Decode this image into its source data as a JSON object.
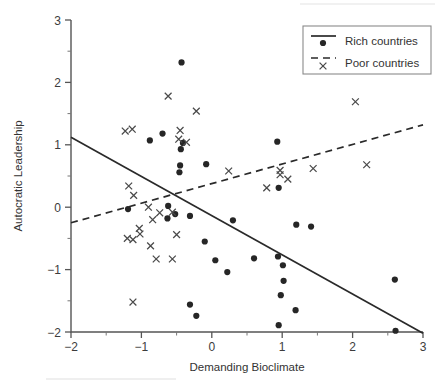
{
  "chart_data": {
    "type": "scatter",
    "title": "",
    "xlabel": "Demanding Bioclimate",
    "ylabel": "Autocratic Leadership",
    "xlim": [
      -2,
      3
    ],
    "ylim": [
      -2,
      3
    ],
    "xticks": [
      -2,
      -1,
      0,
      1,
      2,
      3
    ],
    "xticklabels": [
      "−2",
      "−1",
      "0",
      "1",
      "2",
      "3"
    ],
    "yticks": [
      -2,
      -1,
      0,
      1,
      2,
      3
    ],
    "yticklabels": [
      "−2",
      "−1",
      "0",
      "1",
      "2",
      "3"
    ],
    "xminorticks": [
      -1.5,
      -0.5,
      0.5,
      1.5,
      2.5
    ],
    "yminorticks": [
      -1.5,
      -0.5,
      0.5,
      1.5,
      2.5
    ],
    "grid": false,
    "legend_position": "top-right",
    "series": [
      {
        "name": "Rich countries",
        "marker": "dot",
        "color": "#262626",
        "points": [
          [
            -0.43,
            2.32
          ],
          [
            -0.7,
            1.18
          ],
          [
            -0.88,
            1.07
          ],
          [
            -0.44,
            0.93
          ],
          [
            -0.41,
            1.03
          ],
          [
            -0.45,
            0.67
          ],
          [
            -0.46,
            0.56
          ],
          [
            -0.08,
            0.69
          ],
          [
            0.93,
            1.05
          ],
          [
            0.95,
            0.31
          ],
          [
            -1.19,
            -0.03
          ],
          [
            -0.62,
            0.02
          ],
          [
            -0.63,
            -0.18
          ],
          [
            -0.52,
            -0.11
          ],
          [
            -0.31,
            -0.14
          ],
          [
            0.3,
            -0.21
          ],
          [
            1.2,
            -0.28
          ],
          [
            1.41,
            -0.31
          ],
          [
            -0.1,
            -0.55
          ],
          [
            0.05,
            -0.85
          ],
          [
            0.6,
            -0.82
          ],
          [
            0.94,
            -0.79
          ],
          [
            1.01,
            -0.93
          ],
          [
            0.22,
            -1.04
          ],
          [
            1.02,
            -1.18
          ],
          [
            2.6,
            -1.16
          ],
          [
            0.98,
            -1.41
          ],
          [
            -0.31,
            -1.56
          ],
          [
            1.19,
            -1.65
          ],
          [
            -0.22,
            -1.74
          ],
          [
            0.95,
            -1.89
          ],
          [
            2.61,
            -1.98
          ]
        ]
      },
      {
        "name": "Poor countries",
        "marker": "x",
        "color": "#4a4a4a",
        "points": [
          [
            -0.62,
            1.78
          ],
          [
            -0.22,
            1.54
          ],
          [
            2.04,
            1.69
          ],
          [
            -1.23,
            1.22
          ],
          [
            -1.13,
            1.25
          ],
          [
            -0.45,
            1.23
          ],
          [
            -0.47,
            1.09
          ],
          [
            -0.36,
            1.04
          ],
          [
            0.24,
            0.58
          ],
          [
            1.44,
            0.62
          ],
          [
            2.2,
            0.68
          ],
          [
            0.97,
            0.59
          ],
          [
            0.97,
            0.52
          ],
          [
            1.08,
            0.45
          ],
          [
            0.78,
            0.31
          ],
          [
            -1.18,
            0.34
          ],
          [
            -1.11,
            0.19
          ],
          [
            -0.9,
            0.0
          ],
          [
            -0.74,
            -0.09
          ],
          [
            -0.56,
            -0.08
          ],
          [
            -0.84,
            -0.2
          ],
          [
            -1.03,
            -0.34
          ],
          [
            -1.02,
            -0.43
          ],
          [
            -1.2,
            -0.5
          ],
          [
            -1.12,
            -0.52
          ],
          [
            -0.5,
            -0.44
          ],
          [
            -0.87,
            -0.62
          ],
          [
            -0.79,
            -0.83
          ],
          [
            -0.56,
            -0.83
          ],
          [
            -1.12,
            -1.52
          ]
        ]
      }
    ],
    "fit_lines": [
      {
        "name": "Rich countries fit",
        "style": "solid",
        "x_start": -2,
        "y_start": 1.12,
        "x_end": 3,
        "y_end": -2.02
      },
      {
        "name": "Poor countries fit",
        "style": "dashed",
        "x_start": -2,
        "y_start": -0.25,
        "x_end": 3,
        "y_end": 1.32
      }
    ],
    "legend": [
      {
        "label": "Rich countries",
        "marker": "dot",
        "line": "solid"
      },
      {
        "label": "Poor countries",
        "marker": "x",
        "line": "dashed"
      }
    ]
  }
}
